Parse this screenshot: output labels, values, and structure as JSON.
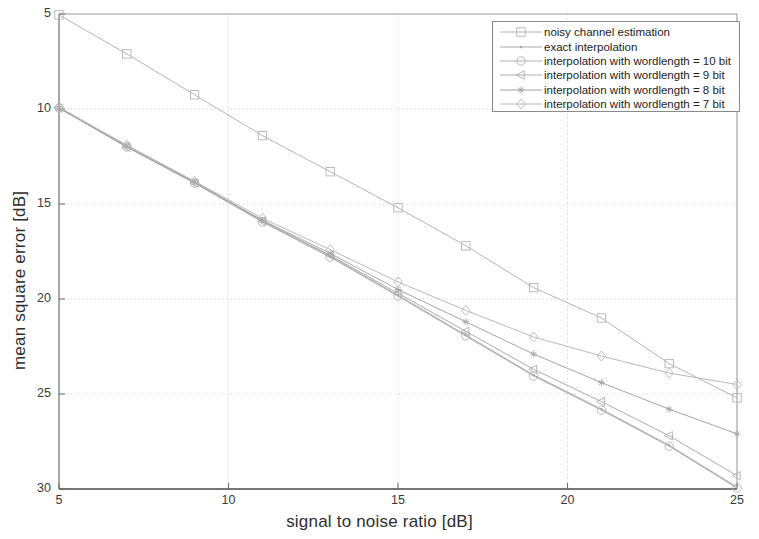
{
  "chart_data": {
    "type": "line",
    "title": "",
    "xlabel": "signal  to  noise ratio [dB]",
    "ylabel": "mean square error [dB]",
    "xlim": [
      5,
      25
    ],
    "ylim": [
      5,
      30
    ],
    "y_inverted": true,
    "xticks": [
      5,
      10,
      15,
      20,
      25
    ],
    "yticks": [
      5,
      10,
      15,
      20,
      25,
      30
    ],
    "grid": "dotted",
    "legend_position": "top-right",
    "x": [
      5,
      7,
      9,
      11,
      13,
      15,
      17,
      19,
      21,
      23,
      25
    ],
    "series": [
      {
        "name": "noisy channel estimation",
        "marker": "square",
        "color": "#b4b4b4",
        "values": [
          5.05,
          7.1,
          9.25,
          11.4,
          13.3,
          15.2,
          17.2,
          19.4,
          21.0,
          23.4,
          25.2
        ]
      },
      {
        "name": "exact interpolation",
        "marker": "dot",
        "color": "#a8a8a8",
        "values": [
          9.95,
          12.0,
          13.85,
          15.9,
          17.75,
          19.8,
          21.9,
          24.0,
          25.8,
          27.7,
          29.9
        ]
      },
      {
        "name": "interpolation with wordlength = 10 bit",
        "marker": "circle",
        "color": "#b0b0b0",
        "values": [
          9.95,
          12.0,
          13.9,
          15.95,
          17.8,
          19.85,
          21.95,
          24.05,
          25.85,
          27.75,
          29.95
        ]
      },
      {
        "name": "interpolation with wordlength = 9 bit",
        "marker": "left-triangle",
        "color": "#acacac",
        "values": [
          9.95,
          12.0,
          13.9,
          15.9,
          17.7,
          19.7,
          21.7,
          23.7,
          25.4,
          27.2,
          29.3
        ]
      },
      {
        "name": "interpolation with wordlength = 8 bit",
        "marker": "asterisk",
        "color": "#a5a5a5",
        "values": [
          9.95,
          11.95,
          13.85,
          15.85,
          17.6,
          19.5,
          21.2,
          22.9,
          24.4,
          25.8,
          27.1
        ]
      },
      {
        "name": "interpolation with wordlength = 7 bit",
        "marker": "diamond",
        "color": "#b8b8b8",
        "values": [
          9.9,
          11.9,
          13.8,
          15.75,
          17.4,
          19.1,
          20.6,
          22.0,
          23.0,
          23.9,
          24.5
        ]
      }
    ]
  },
  "axes": {
    "xtick_labels": [
      "5",
      "10",
      "15",
      "20",
      "25"
    ],
    "ytick_labels": [
      "5",
      "10",
      "15",
      "20",
      "25",
      "30"
    ],
    "xlabel": "signal  to  noise ratio [dB]",
    "ylabel": "mean square error [dB]"
  },
  "legend": {
    "entries": [
      {
        "label": "noisy channel estimation",
        "marker": "square-marker"
      },
      {
        "label": "exact interpolation",
        "marker": "dot-marker"
      },
      {
        "label": "interpolation with wordlength = 10 bit",
        "marker": "circle-marker"
      },
      {
        "label": "interpolation with wordlength = 9 bit",
        "marker": "left-triangle-marker"
      },
      {
        "label": "interpolation with wordlength = 8 bit",
        "marker": "asterisk-marker"
      },
      {
        "label": "interpolation with wordlength = 7 bit",
        "marker": "diamond-marker"
      }
    ]
  },
  "colors": {
    "axis": "#8d8d8d",
    "grid": "#d9b9b9",
    "text": "#2b2b2b",
    "legend_border": "#8a8a8a"
  }
}
